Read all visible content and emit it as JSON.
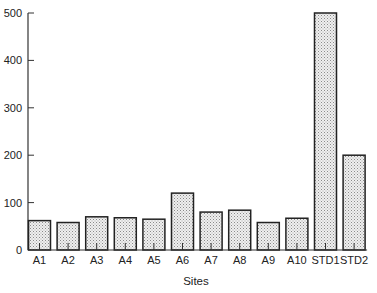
{
  "chart_data": {
    "type": "bar",
    "title": "",
    "xlabel": "Sites",
    "ylabel": "",
    "categories": [
      "A1",
      "A2",
      "A3",
      "A4",
      "A5",
      "A6",
      "A7",
      "A8",
      "A9",
      "A10",
      "STD1",
      "STD2"
    ],
    "values": [
      62,
      58,
      70,
      68,
      65,
      120,
      80,
      84,
      58,
      67,
      500,
      200
    ],
    "ylim": [
      0,
      500
    ],
    "yticks": [
      0,
      100,
      200,
      300,
      400,
      500
    ],
    "grid": false,
    "legend": null,
    "bar_fill": "stippled light gray",
    "colors": {
      "bar_fill": "#e4e4e4",
      "bar_stroke": "#222222",
      "axis": "#333333"
    }
  }
}
